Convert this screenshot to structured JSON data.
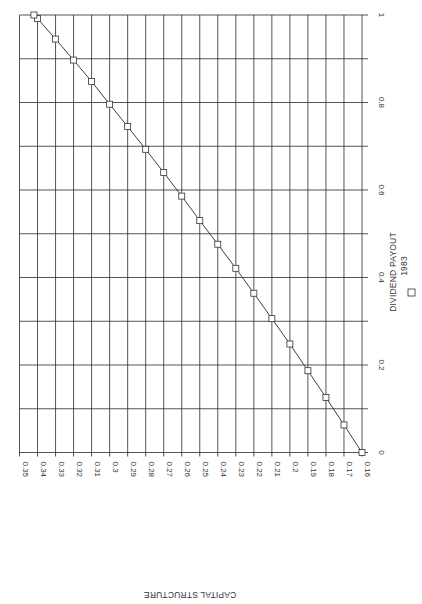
{
  "chart_data": {
    "type": "line",
    "orientation": "rotated 90 degrees clockwise (scanned page)",
    "title": "",
    "xlabel": "DIVIDEND PAYOUT",
    "ylabel": "CAPITAL STRUCTURE",
    "xlim": [
      0,
      1
    ],
    "ylim": [
      0.16,
      0.35
    ],
    "x_ticks": [
      "0",
      "0.2",
      "0.4",
      "0.6",
      "0.8",
      "1"
    ],
    "y_ticks": [
      "0.35",
      "0.34",
      "0.33",
      "0.32",
      "0.31",
      "0.3",
      "0.29",
      "0.28",
      "0.27",
      "0.26",
      "0.25",
      "0.24",
      "0.23",
      "0.22",
      "0.21",
      "0.2",
      "0.19",
      "0.18",
      "0.17",
      "0.16"
    ],
    "grid": true,
    "legend": {
      "position": "below x-axis label",
      "entries": [
        {
          "marker": "square",
          "label": "1983"
        }
      ]
    },
    "series": [
      {
        "name": "1983",
        "marker": "square",
        "x": [
          0.0,
          0.063,
          0.126,
          0.187,
          0.248,
          0.306,
          0.364,
          0.421,
          0.476,
          0.53,
          0.586,
          0.64,
          0.693,
          0.745,
          0.796,
          0.848,
          0.897,
          0.945,
          0.992,
          1.0
        ],
        "y": [
          0.16,
          0.17,
          0.18,
          0.19,
          0.2,
          0.21,
          0.22,
          0.23,
          0.24,
          0.25,
          0.26,
          0.27,
          0.28,
          0.29,
          0.3,
          0.31,
          0.32,
          0.33,
          0.34,
          0.342
        ]
      }
    ]
  },
  "labels": {
    "x_title": "DIVIDEND PAYOUT",
    "legend_label": "1983",
    "y_title": "CAPITAL STRUCTURE"
  }
}
